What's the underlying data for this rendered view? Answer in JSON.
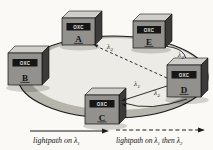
{
  "diagram": {
    "kind": "wdm-ring-lightpath-figure",
    "nodes": [
      {
        "device": "OXC",
        "letter": "A"
      },
      {
        "device": "OXC",
        "letter": "B"
      },
      {
        "device": "OXC",
        "letter": "C"
      },
      {
        "device": "OXC",
        "letter": "D"
      },
      {
        "device": "OXC",
        "letter": "E"
      }
    ],
    "lightpaths": [
      {
        "from": "D",
        "to": "A",
        "style": "dashed",
        "lambda": "λ",
        "sub": "2"
      },
      {
        "from": "D",
        "to": "C",
        "style": "solid",
        "lambda": "λ",
        "sub": "1"
      },
      {
        "from": "E",
        "to": "D",
        "style": "solid",
        "lambda": "λ",
        "sub": "2"
      },
      {
        "from": "D",
        "to": "C",
        "style": "solid-arc",
        "lambda": "λ",
        "sub": "2"
      }
    ],
    "legend": {
      "solid": {
        "pre": "lightpath on ",
        "lambda": "λ",
        "sub": "1"
      },
      "dashed": {
        "pre": "lightpath on ",
        "lambda1": "λ",
        "sub1": "1",
        "mid": " then ",
        "lambda2": "λ",
        "sub2": "2"
      }
    },
    "colors": {
      "background": "#faf9f6",
      "ring_fill": "#edebe5",
      "ring_band": "#b7b4ab",
      "ring_stroke": "#1a1a1a",
      "cube_front": "#92918e",
      "cube_top": "#cfcec9",
      "cube_side": "#3c3b39",
      "label_strip": "#161616",
      "strip_text": "#e6e6e4",
      "line": "#1a1a1a"
    }
  }
}
